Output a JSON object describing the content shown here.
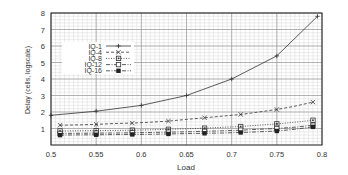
{
  "chart_data": {
    "type": "line",
    "title": "",
    "xlabel": "Load",
    "ylabel": "Delay (cells, logscale)",
    "xlim": [
      0.5,
      0.8
    ],
    "ylim": [
      0,
      8
    ],
    "x_ticks": [
      "0.5",
      "0.55",
      "0.6",
      "0.65",
      "0.7",
      "0.75",
      "0.8"
    ],
    "y_ticks": [
      "1",
      "2",
      "3",
      "4",
      "5",
      "6",
      "7",
      "8"
    ],
    "grid": true,
    "legend_position": "upper-left",
    "series": [
      {
        "name": "IQ-1",
        "marker": "plus",
        "dash": "solid",
        "x": [
          0.5,
          0.55,
          0.6,
          0.65,
          0.7,
          0.75,
          0.795
        ],
        "y": [
          1.8,
          2.05,
          2.4,
          3.0,
          4.0,
          5.4,
          7.8
        ]
      },
      {
        "name": "IQ-4",
        "marker": "cross",
        "dash": "dashed",
        "x": [
          0.51,
          0.53,
          0.55,
          0.57,
          0.59,
          0.61,
          0.63,
          0.65,
          0.67,
          0.69,
          0.71,
          0.73,
          0.75,
          0.77,
          0.79
        ],
        "y": [
          1.2,
          1.22,
          1.25,
          1.3,
          1.33,
          1.38,
          1.45,
          1.55,
          1.65,
          1.75,
          1.85,
          2.0,
          2.15,
          2.35,
          2.6
        ]
      },
      {
        "name": "IQ-8",
        "marker": "square-dot",
        "dash": "dotted",
        "x": [
          0.51,
          0.53,
          0.55,
          0.57,
          0.59,
          0.61,
          0.63,
          0.65,
          0.67,
          0.69,
          0.71,
          0.73,
          0.75,
          0.77,
          0.79
        ],
        "y": [
          0.85,
          0.86,
          0.87,
          0.88,
          0.9,
          0.92,
          0.95,
          0.98,
          1.02,
          1.07,
          1.12,
          1.2,
          1.28,
          1.38,
          1.5
        ]
      },
      {
        "name": "IQ-12",
        "marker": "square-open",
        "dash": "dashdot",
        "x": [
          0.51,
          0.53,
          0.55,
          0.57,
          0.59,
          0.61,
          0.63,
          0.65,
          0.67,
          0.69,
          0.71,
          0.73,
          0.75,
          0.77,
          0.79
        ],
        "y": [
          0.7,
          0.71,
          0.72,
          0.73,
          0.74,
          0.76,
          0.78,
          0.8,
          0.83,
          0.86,
          0.9,
          0.95,
          1.0,
          1.08,
          1.2
        ]
      },
      {
        "name": "IQ-16",
        "marker": "square-filled",
        "dash": "dashdot",
        "x": [
          0.51,
          0.53,
          0.55,
          0.57,
          0.59,
          0.61,
          0.63,
          0.65,
          0.67,
          0.69,
          0.71,
          0.73,
          0.75,
          0.77,
          0.79
        ],
        "y": [
          0.6,
          0.61,
          0.62,
          0.63,
          0.64,
          0.65,
          0.67,
          0.69,
          0.71,
          0.73,
          0.76,
          0.8,
          0.85,
          0.95,
          1.1
        ]
      }
    ]
  },
  "colors": {
    "line": "#333333",
    "grid": "#bfbfbf",
    "axis": "#222222",
    "background": "#ffffff"
  }
}
